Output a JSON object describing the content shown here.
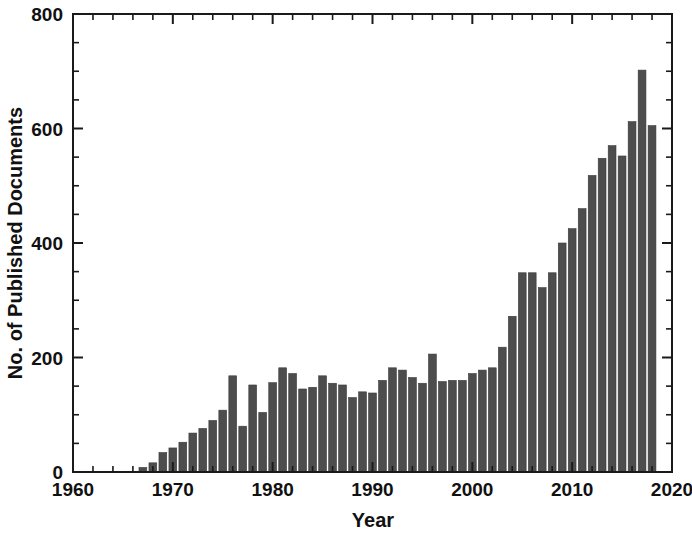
{
  "chart_data": {
    "type": "bar",
    "title": "",
    "xlabel": "Year",
    "ylabel": "No. of Published Documents",
    "xlim": [
      1960,
      2020
    ],
    "ylim": [
      0,
      800
    ],
    "grid": false,
    "legend": null,
    "x_major_ticks": [
      1960,
      1970,
      1980,
      1990,
      2000,
      2010,
      2020
    ],
    "x_major_tick_labels": [
      "1960",
      "1970",
      "1980",
      "1990",
      "2000",
      "2010",
      "2020"
    ],
    "x_minor_tick_step": 2,
    "y_major_ticks": [
      0,
      200,
      400,
      600,
      800
    ],
    "y_major_tick_labels": [
      "0",
      "200",
      "400",
      "600",
      "800"
    ],
    "y_minor_tick_step": 50,
    "bar_color": "#4d4d4d",
    "axis_color": "#1a1a1a",
    "categories": [
      1961,
      1962,
      1963,
      1964,
      1965,
      1966,
      1967,
      1968,
      1969,
      1970,
      1971,
      1972,
      1973,
      1974,
      1975,
      1976,
      1977,
      1978,
      1979,
      1980,
      1981,
      1982,
      1983,
      1984,
      1985,
      1986,
      1987,
      1988,
      1989,
      1990,
      1991,
      1992,
      1993,
      1994,
      1995,
      1996,
      1997,
      1998,
      1999,
      2000,
      2001,
      2002,
      2003,
      2004,
      2005,
      2006,
      2007,
      2008,
      2009,
      2010,
      2011,
      2012,
      2013,
      2014,
      2015,
      2016,
      2017,
      2018
    ],
    "values": [
      1,
      1,
      1,
      1,
      1,
      1,
      8,
      16,
      34,
      42,
      52,
      68,
      76,
      90,
      108,
      168,
      80,
      152,
      104,
      156,
      182,
      172,
      145,
      148,
      168,
      155,
      152,
      130,
      140,
      138,
      160,
      182,
      178,
      165,
      155,
      206,
      158,
      160,
      160,
      172,
      178,
      182,
      218,
      272,
      348,
      348,
      322,
      348,
      400,
      425,
      460,
      518,
      548,
      570,
      552,
      612,
      702,
      605
    ]
  },
  "axes": {
    "x_title": "Year",
    "y_title": "No. of Published Documents"
  }
}
